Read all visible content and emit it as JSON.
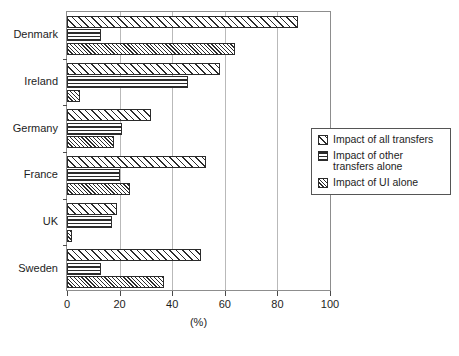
{
  "chart_data": {
    "type": "bar",
    "orientation": "horizontal",
    "title": "",
    "xlabel": "(%)",
    "ylabel": "",
    "xlim": [
      0,
      100
    ],
    "xticks": [
      0,
      20,
      40,
      60,
      80,
      100
    ],
    "xticklabels": [
      "0",
      "20",
      "40",
      "60",
      "80",
      "100"
    ],
    "grid": "vertical",
    "legend_position": "right",
    "categories": [
      "Denmark",
      "Ireland",
      "Germany",
      "France",
      "UK",
      "Sweden"
    ],
    "series": [
      {
        "name": "Impact of all transfers",
        "pattern": "diagonal-hatch",
        "values": [
          88,
          58,
          32,
          53,
          19,
          51
        ]
      },
      {
        "name": "Impact of other transfers alone",
        "pattern": "horizontal-lines",
        "values": [
          13,
          46,
          21,
          20,
          17,
          13
        ]
      },
      {
        "name": "Impact of UI alone",
        "pattern": "fine-diagonal-hatch",
        "values": [
          64,
          5,
          18,
          24,
          2,
          37
        ]
      }
    ]
  },
  "legend": {
    "entries": [
      "Impact of all transfers",
      "Impact of other transfers alone",
      "Impact of UI alone"
    ]
  },
  "colors": {
    "hatch": "#2b2b2b",
    "frame": "#8d8d8d",
    "gridline": "#b9b9b9",
    "background": "#ffffff"
  }
}
